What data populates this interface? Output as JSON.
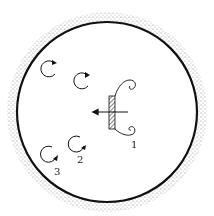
{
  "diagram": {
    "type": "vortex-shedding-in-cylinder",
    "labels": {
      "label_1": "1",
      "label_2": "2",
      "label_3": "3"
    },
    "elements": {
      "container": "circular vessel with stippled outer wall",
      "plate": "hatched vertical plate with curled vortices at top and bottom edges",
      "motion_arrow": "leftward arrow through plate",
      "vortices": [
        "upper-left near wall",
        "upper-center",
        "lower-center (2)",
        "lower-left near wall (3)"
      ]
    },
    "colors": {
      "stroke": "#111111",
      "stipple": "#9a9a9a",
      "background": "#ffffff"
    }
  }
}
